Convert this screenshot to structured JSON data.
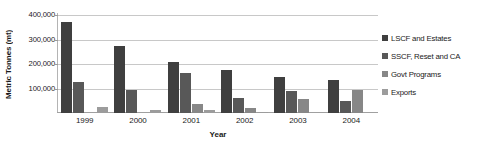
{
  "chart_data": {
    "type": "bar",
    "title": "",
    "xlabel": "Year",
    "ylabel": "Metric Tonnes (mt)",
    "categories": [
      "1999",
      "2000",
      "2001",
      "2002",
      "2003",
      "2004"
    ],
    "ylim": [
      0,
      400000
    ],
    "yticks": [
      {
        "value": 400000,
        "label": "400,000"
      },
      {
        "value": 300000,
        "label": "300,000"
      },
      {
        "value": 200000,
        "label": "200,000"
      },
      {
        "value": 100000,
        "label": "100,000"
      }
    ],
    "grid": true,
    "legend_position": "right",
    "series": [
      {
        "name": "LSCF and Estates",
        "color": "#3f3f3f",
        "values": [
          370000,
          272000,
          207000,
          176000,
          148000,
          135000
        ]
      },
      {
        "name": "SSCF, Reset and CA",
        "color": "#585858",
        "values": [
          128000,
          95000,
          165000,
          60000,
          88000,
          48000
        ]
      },
      {
        "name": "Govt Programs",
        "color": "#878787",
        "values": [
          0,
          0,
          38000,
          20000,
          58000,
          95000
        ]
      },
      {
        "name": "Exports",
        "color": "#9c9c9c",
        "values": [
          25000,
          12000,
          12000,
          6000,
          0,
          0
        ]
      }
    ]
  }
}
